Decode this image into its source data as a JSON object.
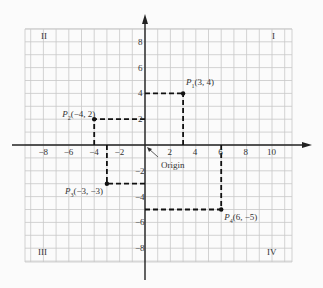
{
  "diagram": {
    "type": "coordinate-plane",
    "colors": {
      "grid": "#c8c8c8",
      "axis": "#222222",
      "dashed": "#111111",
      "background": "#fbfbfb"
    },
    "x_ticks": [
      {
        "value": -8,
        "label": "−8"
      },
      {
        "value": -6,
        "label": "−6"
      },
      {
        "value": -4,
        "label": "−4"
      },
      {
        "value": -2,
        "label": "−2"
      },
      {
        "value": 2,
        "label": "2"
      },
      {
        "value": 4,
        "label": "4"
      },
      {
        "value": 6,
        "label": "6"
      },
      {
        "value": 8,
        "label": "8"
      },
      {
        "value": 10,
        "label": "10"
      }
    ],
    "y_ticks": [
      {
        "value": 8,
        "label": "8"
      },
      {
        "value": 6,
        "label": "6"
      },
      {
        "value": 4,
        "label": "4"
      },
      {
        "value": 2,
        "label": "2"
      },
      {
        "value": -2,
        "label": "−2"
      },
      {
        "value": -4,
        "label": "−4"
      },
      {
        "value": -6,
        "label": "−6"
      },
      {
        "value": -8,
        "label": "−8"
      }
    ],
    "quadrants": {
      "q1": "I",
      "q2": "II",
      "q3": "III",
      "q4": "IV"
    },
    "origin_label": "Origin",
    "points": [
      {
        "name": "P",
        "sub": "1",
        "coords": "(3, 4)",
        "x": 3,
        "y": 4
      },
      {
        "name": "P",
        "sub": "2",
        "coords": "(−4, 2)",
        "x": -4,
        "y": 2
      },
      {
        "name": "P",
        "sub": "3",
        "coords": "(−3, −3)",
        "x": -3,
        "y": -3
      },
      {
        "name": "P",
        "sub": "4",
        "coords": "(6, −5)",
        "x": 6,
        "y": -5
      }
    ]
  }
}
